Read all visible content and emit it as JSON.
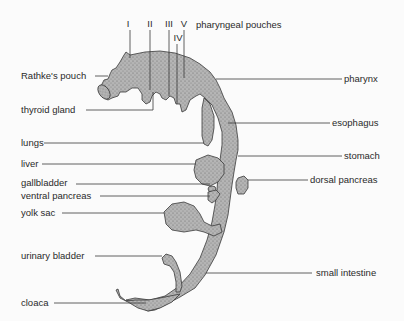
{
  "diagram": {
    "title": "pharyngeal pouches",
    "pouches": {
      "I": "I",
      "II": "II",
      "III": "III",
      "IV": "IV",
      "V": "V"
    },
    "labels_left": {
      "rathkes_pouch": "Rathke's pouch",
      "thyroid_gland": "thyroid gland",
      "lungs": "lungs",
      "liver": "liver",
      "gallbladder": "gallbladder",
      "ventral_pancreas": "ventral pancreas",
      "yolk_sac": "yolk sac",
      "urinary_bladder": "urinary bladder",
      "cloaca": "cloaca"
    },
    "labels_right": {
      "pharynx": "pharynx",
      "esophagus": "esophagus",
      "stomach": "stomach",
      "dorsal_pancreas": "dorsal pancreas",
      "small_intestine": "small intestine"
    },
    "colors": {
      "organ_fill": "#a9a9a9",
      "outline": "#3a3a3a",
      "background": "#fbfbfb"
    }
  }
}
